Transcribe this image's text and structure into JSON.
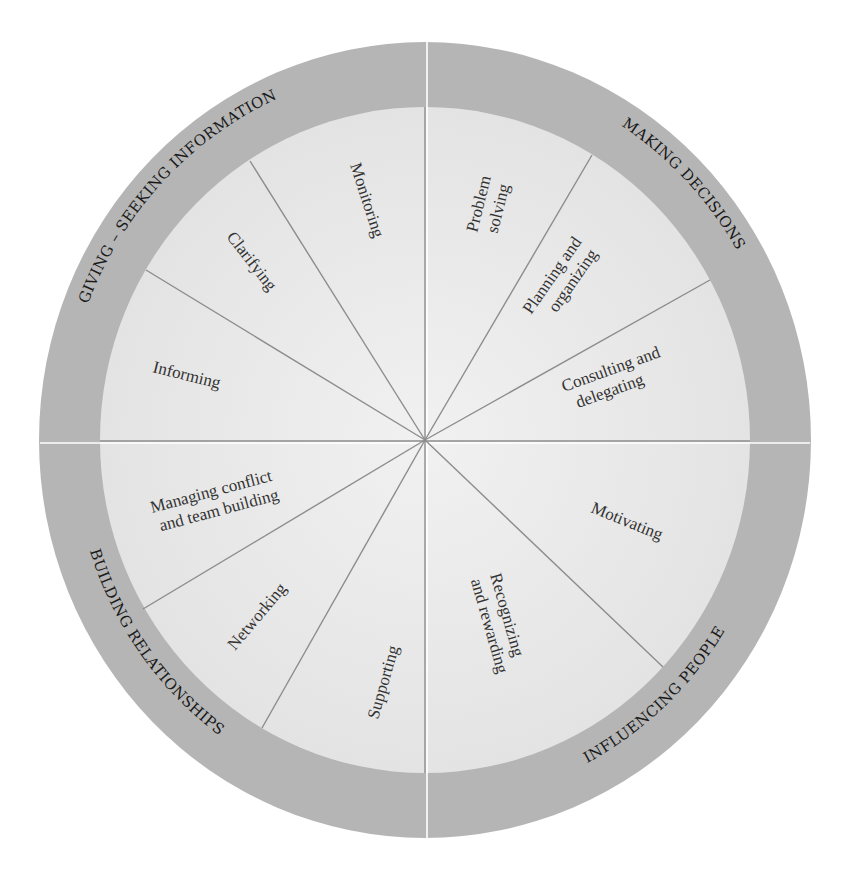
{
  "diagram": {
    "type": "wheel",
    "colors": {
      "outer_ring": "#b5b5b5",
      "inner_fill": "#e9e9e9",
      "spoke": "#8c8c8c",
      "text": "#222222"
    },
    "categories": [
      {
        "label": "GIVING – SEEKING INFORMATION",
        "behaviors": [
          "Informing",
          "Clarifying",
          "Monitoring"
        ]
      },
      {
        "label": "MAKING DECISIONS",
        "behaviors": [
          "Problem solving",
          "Planning and organizing",
          "Consulting and delegating"
        ]
      },
      {
        "label": "INFLUENCING PEOPLE",
        "behaviors": [
          "Motivating",
          "Recognizing and rewarding"
        ]
      },
      {
        "label": "BUILDING RELATIONSHIPS",
        "behaviors": [
          "Supporting",
          "Networking",
          "Managing conflict and team building"
        ]
      }
    ],
    "sector_labels": {
      "monitoring": "Monitoring",
      "clarifying": "Clarifying",
      "informing": "Informing",
      "problem_1": "Problem",
      "problem_2": "solving",
      "planning_1": "Planning and",
      "planning_2": "organizing",
      "consulting_1": "Consulting and",
      "consulting_2": "delegating",
      "motivating": "Motivating",
      "recognizing_1": "Recognizing",
      "recognizing_2": "and rewarding",
      "supporting": "Supporting",
      "networking": "Networking",
      "managing_1": "Managing conflict",
      "managing_2": "and team building"
    },
    "ring_labels": {
      "giving": "GIVING – SEEKING INFORMATION",
      "making": "MAKING DECISIONS",
      "influencing": "INFLUENCING PEOPLE",
      "building": "BUILDING RELATIONSHIPS"
    }
  }
}
